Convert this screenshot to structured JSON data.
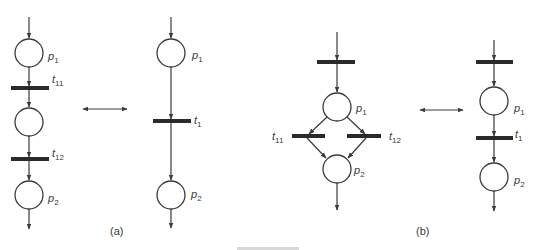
{
  "diagram": {
    "type": "petri-net-equivalence",
    "colors": {
      "stroke": "#3a3a3a",
      "transition": "#2a2a2a",
      "background": "#ffffff"
    },
    "panels": [
      {
        "id": "a",
        "caption": "(a)",
        "left_net": {
          "places": [
            {
              "id": "p1",
              "label": "p",
              "sub": "1"
            },
            {
              "id": "p_mid",
              "label": "",
              "sub": ""
            },
            {
              "id": "p2",
              "label": "p",
              "sub": "2"
            }
          ],
          "transitions": [
            {
              "id": "t11",
              "label": "t",
              "sub": "11"
            },
            {
              "id": "t12",
              "label": "t",
              "sub": "12"
            }
          ]
        },
        "equivalence": "double-arrow",
        "right_net": {
          "places": [
            {
              "id": "p1",
              "label": "p",
              "sub": "1"
            },
            {
              "id": "p2",
              "label": "p",
              "sub": "2"
            }
          ],
          "transitions": [
            {
              "id": "t1",
              "label": "t",
              "sub": "1"
            }
          ]
        }
      },
      {
        "id": "b",
        "caption": "(b)",
        "left_net": {
          "places": [
            {
              "id": "p1",
              "label": "p",
              "sub": "1"
            },
            {
              "id": "p2",
              "label": "p",
              "sub": "2"
            }
          ],
          "transitions": [
            {
              "id": "t_in",
              "label": "",
              "sub": ""
            },
            {
              "id": "t11",
              "label": "t",
              "sub": "11"
            },
            {
              "id": "t12",
              "label": "t",
              "sub": "12"
            }
          ]
        },
        "equivalence": "double-arrow",
        "right_net": {
          "places": [
            {
              "id": "p1",
              "label": "p",
              "sub": "1"
            },
            {
              "id": "p2",
              "label": "p",
              "sub": "2"
            }
          ],
          "transitions": [
            {
              "id": "t_in",
              "label": "",
              "sub": ""
            },
            {
              "id": "t1",
              "label": "t",
              "sub": "1"
            }
          ]
        }
      }
    ]
  }
}
